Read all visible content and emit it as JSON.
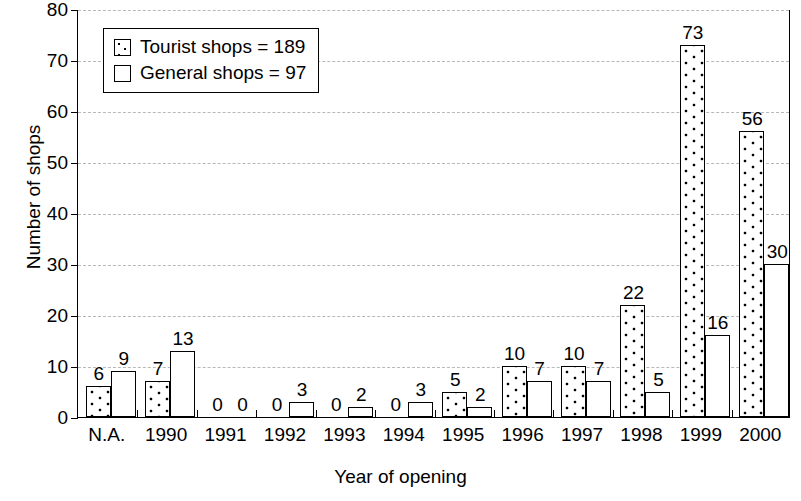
{
  "chart_data": {
    "type": "bar",
    "title": "",
    "xlabel": "Year of opening",
    "ylabel": "Number of shops",
    "ylim": [
      0,
      80
    ],
    "yticks": [
      0,
      10,
      20,
      30,
      40,
      50,
      60,
      70,
      80
    ],
    "grid": true,
    "legend_position": "top-left",
    "categories": [
      "N.A.",
      "1990",
      "1991",
      "1992",
      "1993",
      "1994",
      "1995",
      "1996",
      "1997",
      "1998",
      "1999",
      "2000"
    ],
    "series": [
      {
        "name": "Tourist shops",
        "legend_label": "Tourist shops = 189",
        "total": 189,
        "fill": "dotted",
        "values": [
          6,
          7,
          0,
          0,
          0,
          0,
          5,
          10,
          10,
          22,
          73,
          56
        ]
      },
      {
        "name": "General shops",
        "legend_label": "General shops = 97",
        "total": 97,
        "fill": "white",
        "values": [
          9,
          13,
          0,
          3,
          2,
          3,
          2,
          7,
          7,
          5,
          16,
          30
        ]
      }
    ]
  },
  "colors": {
    "axis": "#000000",
    "gridline": "#b8b8b8",
    "bar_outline": "#000000",
    "background": "#ffffff"
  }
}
